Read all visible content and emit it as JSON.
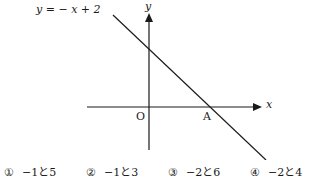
{
  "figure": {
    "equation_label": "y = − x + 2",
    "y_axis_label": "y",
    "x_axis_label": "x",
    "origin_label": "O",
    "point_label": "A",
    "line_color": "#1a1a1a"
  },
  "choices": [
    {
      "number": "①",
      "text": "−1と5"
    },
    {
      "number": "②",
      "text": "−1と3"
    },
    {
      "number": "③",
      "text": "−2と6"
    },
    {
      "number": "④",
      "text": "−2と4"
    }
  ]
}
